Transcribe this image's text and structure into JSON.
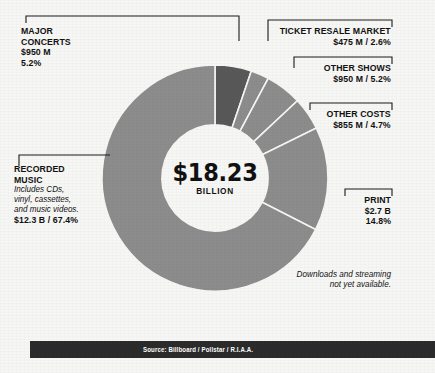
{
  "chart_data": {
    "type": "pie",
    "title": "$18.23 BILLION",
    "center_amount": "$18.23",
    "center_unit": "BILLION",
    "total_label": "$18.23 billion",
    "start_angle": 0,
    "direction": "clockwise",
    "donut_inner_ratio": 0.47,
    "categories": [
      "MAJOR CONCERTS",
      "TICKET RESALE MARKET",
      "OTHER SHOWS",
      "OTHER COSTS",
      "PRINT",
      "RECORDED MUSIC"
    ],
    "values": [
      5.2,
      2.6,
      5.2,
      4.7,
      14.8,
      67.4
    ],
    "amounts": [
      "$950 M",
      "$475 M",
      "$950 M",
      "$855 M",
      "$2.7 B",
      "$12.3 B"
    ],
    "colors": [
      "#585858",
      "#8c8c8c",
      "#8c8c8c",
      "#8c8c8c",
      "#8c8c8c",
      "#8c8c8c"
    ],
    "slice_gap_color": "#f6f6f4",
    "legend": "callout-labels",
    "grid": false,
    "xlabel": "",
    "ylabel": ""
  },
  "callouts": {
    "major_concerts": {
      "name": "MAJOR",
      "name2": "CONCERTS",
      "amount": "$950 M",
      "percent": "5.2%"
    },
    "ticket_resale": {
      "name": "TICKET RESALE MARKET",
      "value": "$475 M / 2.6%"
    },
    "other_shows": {
      "name": "OTHER SHOWS",
      "value": "$950 M / 5.2%"
    },
    "other_costs": {
      "name": "OTHER COSTS",
      "value": "$855 M / 4.7%"
    },
    "print": {
      "name": "PRINT",
      "amount": "$2.7 B",
      "percent": "14.8%"
    },
    "recorded_music": {
      "name": "RECORDED",
      "name2": "MUSIC",
      "sub1": "Includes CDs,",
      "sub2": "vinyl, cassettes,",
      "sub3": "and music videos.",
      "value": "$12.3 B / 67.4%"
    }
  },
  "note": {
    "line1": "Downloads and streaming",
    "line2": "not yet available."
  },
  "source": {
    "text": "Source: Billboard / Pollstar / R.I.A.A."
  },
  "theme": {
    "background": "#f6f6f4",
    "ink": "#111111",
    "slice_dark": "#585858",
    "slice_light": "#8c8c8c",
    "bar_background": "#2b2b2b",
    "bar_text": "#ffffff"
  }
}
